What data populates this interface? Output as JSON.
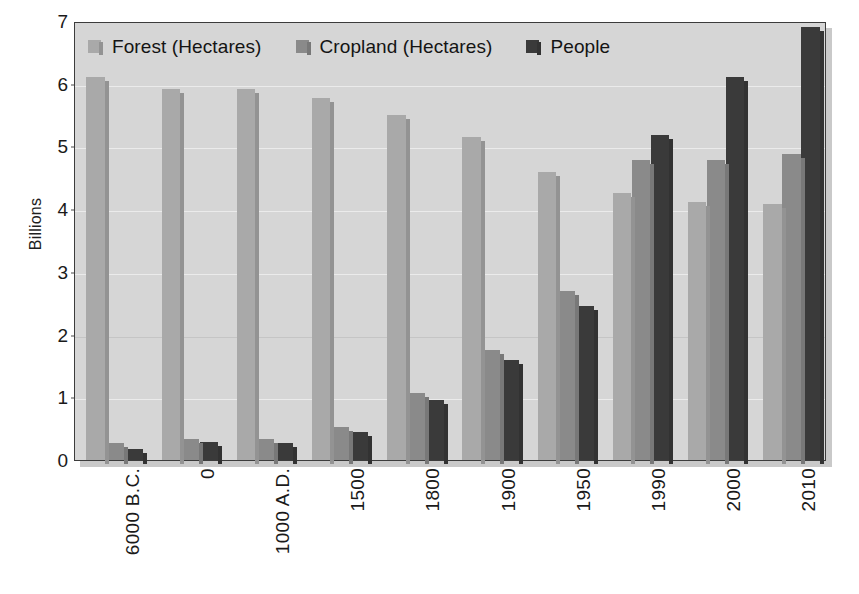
{
  "chart_data": {
    "type": "bar",
    "title": "",
    "subtitle": "",
    "xlabel": "",
    "ylabel": "Billions",
    "ylim": [
      0,
      7
    ],
    "yticks": [
      0,
      1,
      2,
      3,
      4,
      5,
      6,
      7
    ],
    "ytick_labels": [
      "0",
      "1",
      "2",
      "3",
      "4",
      "5",
      "6",
      "7"
    ],
    "grid": true,
    "legend_position": "top-left-inside",
    "categories": [
      "6000 B.C.",
      "0",
      "1000 A.D.",
      "1500",
      "1800",
      "1900",
      "1950",
      "1990",
      "2000",
      "2010"
    ],
    "series": [
      {
        "name": "Forest (Hectares)",
        "color": "#a9a9a9",
        "values": [
          6.1,
          5.92,
          5.92,
          5.78,
          5.5,
          5.15,
          4.6,
          4.25,
          4.12,
          4.08
        ]
      },
      {
        "name": "Cropland (Hectares)",
        "color": "#8a8a8a",
        "values": [
          0.27,
          0.33,
          0.34,
          0.52,
          1.07,
          1.75,
          2.7,
          4.78,
          4.78,
          4.88
        ]
      },
      {
        "name": "People",
        "color": "#3a3a3a",
        "values": [
          0.17,
          0.28,
          0.27,
          0.45,
          0.95,
          1.6,
          2.45,
          5.18,
          6.1,
          6.9
        ]
      }
    ]
  },
  "colors": {
    "plot_background": "#d6d6d6",
    "plot_border": "#3c3c3c",
    "gridline": "#eeeeee",
    "page_background": "#ffffff",
    "text": "#1a1a1a",
    "forest": "#a9a9a9",
    "cropland": "#8a8a8a",
    "people": "#3a3a3a"
  },
  "axis": {
    "y_title": "Billions"
  }
}
